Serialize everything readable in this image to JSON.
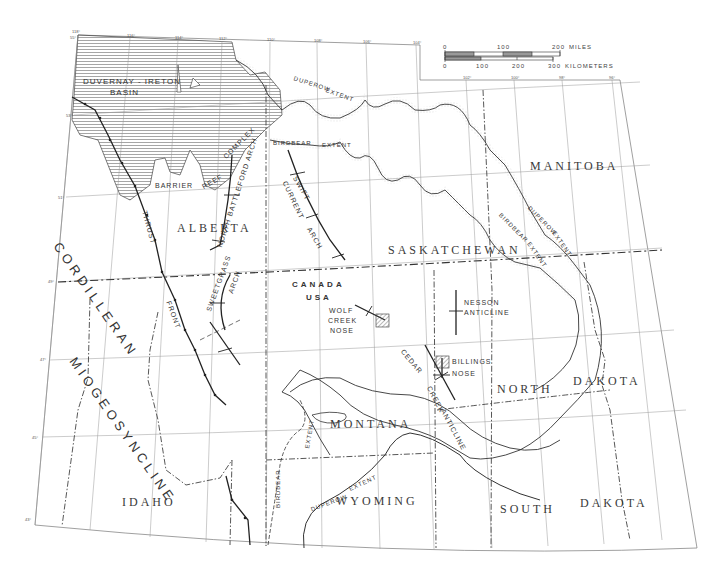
{
  "map": {
    "type": "geologic-structure-map",
    "scale_bar": {
      "miles": {
        "ticks": [
          "0",
          "100",
          "200"
        ],
        "unit": "MILES"
      },
      "kilometers": {
        "ticks": [
          "0",
          "100",
          "200",
          "300"
        ],
        "unit": "KILOMETERS"
      }
    },
    "regions": {
      "alberta": "ALBERTA",
      "saskatchewan": "SASKATCHEWAN",
      "manitoba": "MANITOBA",
      "montana": "MONTANA",
      "north": "NORTH",
      "north_dakota_b": "DAKOTA",
      "south": "SOUTH",
      "south_dakota_b": "DAKOTA",
      "wyoming": "WYOMING",
      "idaho": "IDAHO",
      "canada": "CANADA",
      "usa": "USA"
    },
    "features": {
      "duvernay_a": "DUVERNAY - IRETON",
      "duvernay_b": "BASIN",
      "cordilleran": "CORDILLERAN",
      "miogeosyncline": "MIOGEOSYNCLINE",
      "thrust": "THRUST",
      "front": "FRONT",
      "barrier": "BARRIER",
      "reef": "REEF",
      "complex": "COMPLEX",
      "north_battleford_arch": "NORTH BATTLEFORD ARCH",
      "sweetgrass": "SWEETGRASS",
      "sweetgrass_arch": "ARCH",
      "swift": "SWIFT",
      "current": "CURRENT",
      "swift_arch": "ARCH",
      "birdbear_extent_a": "BIRDBEAR",
      "birdbear_extent_b": "EXTENT",
      "duperow_extent_a": "DUPEROW",
      "duperow_extent_b": "EXTENT",
      "birdbear_e_a": "BIRDBEAR",
      "birdbear_e_b": "EXTENT",
      "duperow_e_a": "DUPEROW",
      "duperow_e_b": "EXTENT",
      "birdbear_s_a": "BIRDBEAR",
      "birdbear_s_b": "EXTENT",
      "duperow_s_a": "DUPEROW",
      "duperow_s_b": "EXTENT",
      "wolf": "WOLF",
      "creek": "CREEK",
      "nose": "NOSE",
      "nesson": "NESSON",
      "anticline": "ANTICLINE",
      "billings": "BILLINGS",
      "billings_nose": "NOSE",
      "cedar": "CEDAR",
      "cedar_creek": "CREEK",
      "cedar_anticline": "ANTICLINE"
    },
    "meridians": [
      "118°",
      "116°",
      "114°",
      "112°",
      "110°",
      "108°",
      "106°",
      "104°",
      "102°",
      "100°",
      "98°",
      "96°"
    ],
    "parallels": [
      "55°",
      "53°",
      "51°",
      "49°",
      "47°",
      "45°",
      "43°"
    ],
    "colors": {
      "ink": "#2a2a2a",
      "grid": "#8a8a8a",
      "stipple": "#b5b5b5",
      "hatch": "#6a6a6a",
      "background": "#ffffff"
    }
  }
}
